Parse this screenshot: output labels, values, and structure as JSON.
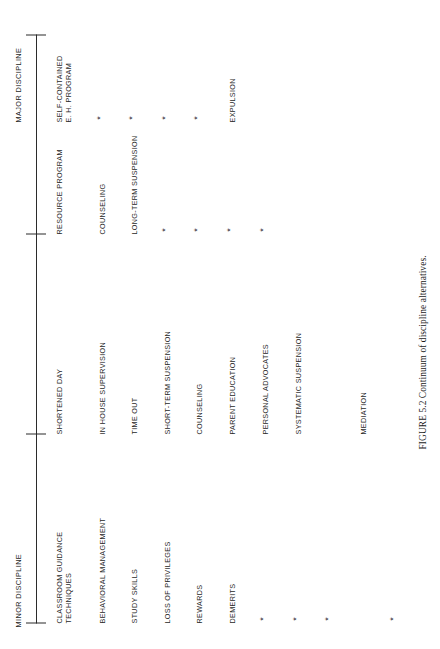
{
  "figure": {
    "caption": "FIGURE 5.2  Continuum of discipline alternatives.",
    "axis": {
      "left_label": "MINOR DISCIPLINE",
      "right_label": "MAJOR DISCIPLINE",
      "tick_count": 4
    }
  },
  "columns": [
    {
      "header": [
        "CLASSROOM GUIDANCE",
        "TECHNIQUES"
      ]
    },
    {
      "header": [
        "SHORTENED DAY"
      ]
    },
    {
      "header": [
        "RESOURCE PROGRAM"
      ]
    },
    {
      "header": [
        "SELF-CONTAINED",
        "E. H. PROGRAM"
      ]
    }
  ],
  "rows": [
    {
      "cells": [
        "BEHAVIORAL MANAGEMENT",
        "IN HOUSE SUPERVISION",
        "COUNSELING",
        ""
      ]
    },
    {
      "cells": [
        "STUDY SKILLS",
        "TIME OUT",
        "LONG-TERM SUSPENSION",
        ""
      ]
    },
    {
      "cells": [
        "LOSS OF PRIVILEGES",
        "SHORT-TERM SUSPENSION",
        "",
        ""
      ]
    },
    {
      "cells": [
        "REWARDS",
        "COUNSELING",
        "",
        ""
      ]
    },
    {
      "cells": [
        "DEMERITS",
        "PARENT EDUCATION",
        "",
        "EXPULSION"
      ]
    },
    {
      "cells": [
        "",
        "PERSONAL ADVOCATES",
        "",
        ""
      ]
    },
    {
      "cells": [
        "",
        "SYSTEMATIC SUSPENSION",
        "",
        ""
      ]
    },
    {
      "cells": [
        "",
        "MEDIATION",
        "",
        ""
      ]
    }
  ],
  "marks": {
    "glyph": "*",
    "positions": [
      {
        "col": 4,
        "row": 1
      },
      {
        "col": 4,
        "row": 2
      },
      {
        "col": 4,
        "row": 3
      },
      {
        "col": 4,
        "row": 4
      },
      {
        "col": 3,
        "row": 3
      },
      {
        "col": 3,
        "row": 4
      },
      {
        "col": 3,
        "row": 5
      },
      {
        "col": 3,
        "row": 6
      },
      {
        "col": 1,
        "row": 5
      },
      {
        "col": 1,
        "row": 6
      },
      {
        "col": 1,
        "row": 7
      },
      {
        "col": 1,
        "row": 8
      }
    ]
  },
  "colors": {
    "ink": "#1f1f1f",
    "rule": "#2b2b2b",
    "page": "#ffffff"
  }
}
